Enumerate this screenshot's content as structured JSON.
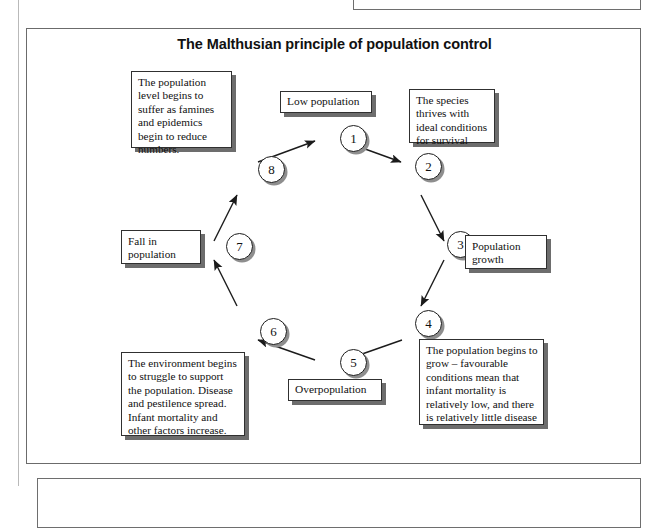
{
  "figure": {
    "title": "The Malthusian principle of population control",
    "diagram_type": "cycle-diagram",
    "direction": "clockwise",
    "nodes": [
      {
        "number": "1",
        "cx": 327,
        "cy": 137
      },
      {
        "number": "2",
        "cx": 402,
        "cy": 165
      },
      {
        "number": "3",
        "cx": 434,
        "cy": 243
      },
      {
        "number": "4",
        "cx": 402,
        "cy": 322
      },
      {
        "number": "5",
        "cx": 327,
        "cy": 361
      },
      {
        "number": "6",
        "cx": 247,
        "cy": 330
      },
      {
        "number": "7",
        "cx": 213,
        "cy": 245
      },
      {
        "number": "8",
        "cx": 245,
        "cy": 168
      }
    ],
    "labels": {
      "node1": "Low population",
      "node2": "The species thrives with ideal conditions for survival",
      "node3": "Population growth",
      "node4": "The population begins to  grow – favourable conditions mean that infant mortality is relatively low, and there is relatively little disease",
      "node5": "Overpopulation",
      "node6": "The environment begins to struggle to support the population. Disease and pestilence spread. Infant mortality and other factors increase.",
      "node7": "Fall in population",
      "node8": "The population level begins to suffer as famines and epidemics begin to reduce numbers."
    }
  },
  "colors": {
    "frame_border": "#6b6b6b",
    "box_border": "#303030",
    "box_shadow": "#6d6d6d",
    "node_shadow": "#8e8e8e",
    "ink": "#111111",
    "paper": "#ffffff"
  }
}
